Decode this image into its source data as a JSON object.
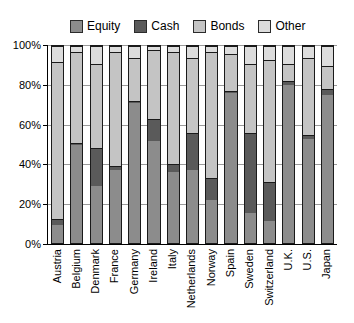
{
  "chart_data": {
    "type": "bar",
    "stacked": true,
    "title": "",
    "xlabel": "",
    "ylabel": "",
    "ylim": [
      0,
      100
    ],
    "ytick_labels": [
      "0%",
      "20%",
      "40%",
      "60%",
      "80%",
      "100%"
    ],
    "ytick_values": [
      0,
      20,
      40,
      60,
      80,
      100
    ],
    "grid": true,
    "legend_position": "top",
    "categories": [
      "Austria",
      "Belgium",
      "Denmark",
      "France",
      "Germany",
      "Ireland",
      "Italy",
      "Netherlands",
      "Norway",
      "Spain",
      "Sweden",
      "Switzerland",
      "U.K.",
      "U.S.",
      "Japan"
    ],
    "series": [
      {
        "name": "Equity",
        "color": "#8c8c8c",
        "values": [
          9,
          50,
          29,
          37,
          71,
          52,
          36,
          37,
          22,
          76,
          15,
          11,
          80,
          53,
          75
        ]
      },
      {
        "name": "Cash",
        "color": "#5a5a5a",
        "values": [
          3,
          1,
          19,
          2,
          1,
          11,
          4,
          19,
          11,
          1,
          41,
          20,
          2,
          2,
          3
        ]
      },
      {
        "name": "Bonds",
        "color": "#c4c4c4",
        "values": [
          80,
          46,
          43,
          58,
          22,
          35,
          57,
          38,
          64,
          19,
          35,
          62,
          9,
          39,
          12
        ]
      },
      {
        "name": "Other",
        "color": "#dcdcdc",
        "values": [
          8,
          3,
          9,
          3,
          6,
          2,
          3,
          6,
          3,
          4,
          9,
          7,
          9,
          6,
          10
        ]
      }
    ]
  },
  "legend": {
    "items": [
      {
        "label": "Equity",
        "color": "#8c8c8c"
      },
      {
        "label": "Cash",
        "color": "#5a5a5a"
      },
      {
        "label": "Bonds",
        "color": "#c4c4c4"
      },
      {
        "label": "Other",
        "color": "#dcdcdc"
      }
    ]
  }
}
